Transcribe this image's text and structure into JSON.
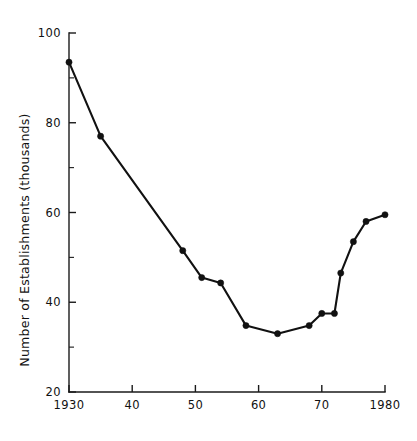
{
  "chart_data": {
    "type": "line",
    "title": "",
    "subtitle": "",
    "xlabel": "",
    "ylabel": "Number of Establishments (thousands)",
    "xlim": [
      1930,
      1980
    ],
    "ylim": [
      20,
      100
    ],
    "grid": false,
    "legend": null,
    "x_ticks_major": [
      {
        "value": 1930,
        "label": "1930"
      },
      {
        "value": 1940,
        "label": "40"
      },
      {
        "value": 1950,
        "label": "50"
      },
      {
        "value": 1960,
        "label": "60"
      },
      {
        "value": 1970,
        "label": "70"
      },
      {
        "value": 1980,
        "label": "1980"
      }
    ],
    "y_ticks_major": [
      {
        "value": 100,
        "label": "100"
      },
      {
        "value": 80,
        "label": "80"
      },
      {
        "value": 60,
        "label": "60"
      },
      {
        "value": 40,
        "label": "40"
      },
      {
        "value": 20,
        "label": "20"
      }
    ],
    "y_ticks_minor": [
      90,
      70,
      50,
      30
    ],
    "marker": "filled-circle",
    "line_color": "#111111",
    "marker_color": "#111111",
    "series": [
      {
        "name": "Number of Establishments",
        "x": [
          1930,
          1935,
          1948,
          1951,
          1954,
          1958,
          1963,
          1968,
          1970,
          1972,
          1973,
          1975,
          1977,
          1980
        ],
        "values": [
          93.5,
          77.0,
          51.5,
          45.5,
          44.3,
          34.8,
          33.0,
          34.8,
          37.5,
          37.5,
          46.5,
          53.5,
          58.0,
          59.5
        ]
      }
    ]
  },
  "figure": {
    "background_color": "#ffffff",
    "foreground_color": "#111111"
  }
}
